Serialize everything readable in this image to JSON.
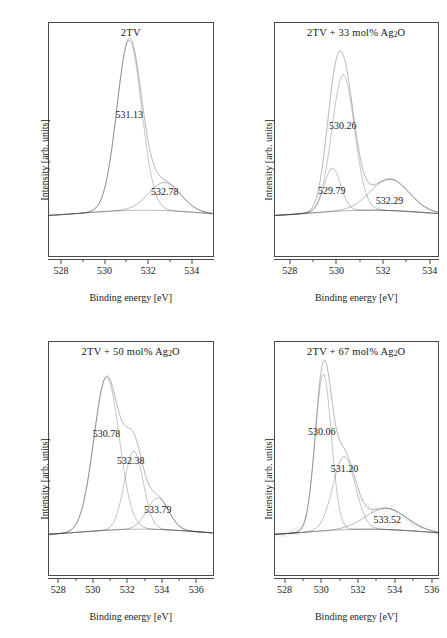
{
  "figure": {
    "axis_titles": {
      "x": "Binding energy [eV]",
      "y": "Intensity [arb. units]"
    }
  },
  "chart_data": [
    {
      "type": "line",
      "title": "2TV",
      "title_plain": "2TV",
      "xlabel": "Binding energy [eV]",
      "ylabel": "Intensity [arb. units]",
      "xlim": [
        527.4,
        535.0
      ],
      "xticks": [
        528,
        530,
        532,
        534
      ],
      "xticklabels": [
        "528",
        "530",
        "532",
        "534"
      ],
      "grid": false,
      "annotations": [
        {
          "text": "531.13",
          "x": 531.13,
          "y_frac": 0.62
        },
        {
          "text": "532.78",
          "x": 532.78,
          "y_frac": 0.17
        }
      ],
      "components": [
        {
          "name": "peak-1",
          "center": 531.13,
          "fwhm": 1.35,
          "amplitude": 1.0
        },
        {
          "name": "peak-2",
          "center": 532.78,
          "fwhm": 1.75,
          "amplitude": 0.165
        }
      ],
      "series": [
        {
          "name": "envelope",
          "style": "solid"
        },
        {
          "name": "measured-data",
          "style": "dotted-points"
        },
        {
          "name": "baseline",
          "style": "dotted"
        }
      ]
    },
    {
      "type": "line",
      "title": "2TV + 33 mol% Ag2O",
      "title_plain": "2TV + 33 mol% Ag",
      "title_sub": "2",
      "title_tail": "O",
      "xlabel": "Binding energy [eV]",
      "ylabel": "Intensity [arb. units]",
      "xlim": [
        527.3,
        534.4
      ],
      "xticks": [
        528,
        530,
        532,
        534
      ],
      "xticklabels": [
        "528",
        "530",
        "532",
        "534"
      ],
      "grid": false,
      "annotations": [
        {
          "text": "530.26",
          "x": 530.26,
          "y_frac": 0.56
        },
        {
          "text": "529.79",
          "x": 529.79,
          "y_frac": 0.175
        },
        {
          "text": "532.29",
          "x": 532.29,
          "y_frac": 0.115
        }
      ],
      "components": [
        {
          "name": "peak-1",
          "center": 530.26,
          "fwhm": 1.15,
          "amplitude": 0.8
        },
        {
          "name": "peak-2",
          "center": 529.79,
          "fwhm": 0.85,
          "amplitude": 0.255
        },
        {
          "name": "peak-3",
          "center": 532.29,
          "fwhm": 1.95,
          "amplitude": 0.185
        }
      ],
      "series": [
        {
          "name": "envelope",
          "style": "solid"
        },
        {
          "name": "measured-data",
          "style": "dotted-points"
        },
        {
          "name": "baseline",
          "style": "dotted"
        }
      ]
    },
    {
      "type": "line",
      "title": "2TV + 50 mol% Ag2O",
      "title_plain": "2TV + 50 mol% Ag",
      "title_sub": "2",
      "title_tail": "O",
      "xlabel": "Binding energy [eV]",
      "ylabel": "Intensity [arb. units]",
      "xlim": [
        527.4,
        537.0
      ],
      "xticks": [
        528,
        530,
        532,
        534,
        536
      ],
      "xticklabels": [
        "528",
        "530",
        "532",
        "534",
        "536"
      ],
      "grid": false,
      "annotations": [
        {
          "text": "530.78",
          "x": 530.78,
          "y_frac": 0.625
        },
        {
          "text": "532.38",
          "x": 532.2,
          "y_frac": 0.465
        },
        {
          "text": "533.79",
          "x": 533.79,
          "y_frac": 0.175
        }
      ],
      "components": [
        {
          "name": "peak-1",
          "center": 530.78,
          "fwhm": 1.75,
          "amplitude": 0.9
        },
        {
          "name": "peak-2",
          "center": 532.38,
          "fwhm": 1.3,
          "amplitude": 0.46
        },
        {
          "name": "peak-3",
          "center": 533.79,
          "fwhm": 1.5,
          "amplitude": 0.185
        }
      ],
      "series": [
        {
          "name": "envelope",
          "style": "solid"
        },
        {
          "name": "measured-data",
          "style": "dotted-points"
        },
        {
          "name": "baseline",
          "style": "dotted"
        }
      ]
    },
    {
      "type": "line",
      "title": "2TV + 67 mol% Ag2O",
      "title_plain": "2TV + 67 mol% Ag",
      "title_sub": "2",
      "title_tail": "O",
      "xlabel": "Binding energy [eV]",
      "ylabel": "Intensity [arb. units]",
      "xlim": [
        527.4,
        536.4
      ],
      "xticks": [
        528,
        530,
        532,
        534,
        536
      ],
      "xticklabels": [
        "528",
        "530",
        "532",
        "534",
        "536"
      ],
      "grid": false,
      "annotations": [
        {
          "text": "530.06",
          "x": 530.0,
          "y_frac": 0.635
        },
        {
          "text": "531.20",
          "x": 531.25,
          "y_frac": 0.415
        },
        {
          "text": "533.52",
          "x": 533.6,
          "y_frac": 0.115
        }
      ],
      "components": [
        {
          "name": "peak-1",
          "center": 530.06,
          "fwhm": 1.05,
          "amplitude": 0.92
        },
        {
          "name": "peak-2",
          "center": 531.2,
          "fwhm": 1.45,
          "amplitude": 0.43
        },
        {
          "name": "peak-3",
          "center": 533.52,
          "fwhm": 2.6,
          "amplitude": 0.125
        }
      ],
      "series": [
        {
          "name": "envelope",
          "style": "solid"
        },
        {
          "name": "measured-data",
          "style": "dotted-points"
        },
        {
          "name": "baseline",
          "style": "dotted"
        }
      ]
    }
  ]
}
